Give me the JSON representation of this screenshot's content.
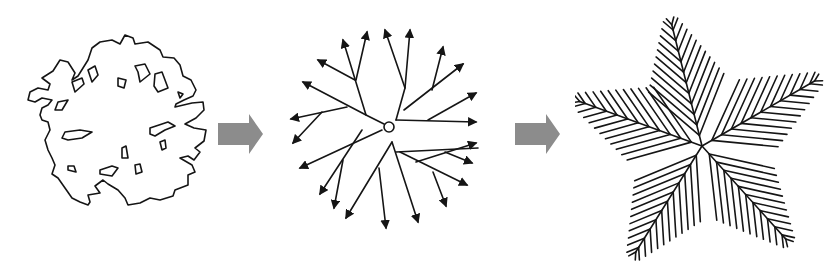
{
  "diagram": {
    "stages": [
      {
        "id": "stage-1",
        "label": "irregular-contour-shape"
      },
      {
        "id": "stage-2",
        "label": "radial-branch-skeleton",
        "center_marker": "circle"
      },
      {
        "id": "stage-3",
        "label": "five-arm-feathered-star"
      }
    ],
    "connectors": [
      {
        "from": "stage-1",
        "to": "stage-2",
        "type": "block-arrow",
        "color": "#8c8c8c"
      },
      {
        "from": "stage-2",
        "to": "stage-3",
        "type": "block-arrow",
        "color": "#8c8c8c"
      }
    ],
    "colors": {
      "ink": "#151515",
      "arrow": "#8c8c8c",
      "background": "#ffffff"
    }
  }
}
